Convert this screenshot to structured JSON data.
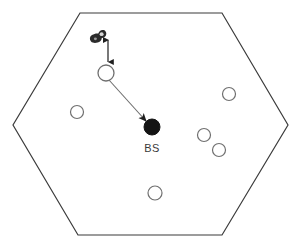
{
  "figure": {
    "type": "diagram",
    "title": "",
    "background_color": "#ffffff",
    "width": 303,
    "height": 245
  },
  "cell": {
    "name": "hexagonal-cell-boundary",
    "shape": "hexagon",
    "stroke_color": "#3b3b3b",
    "stroke_width": 1.2,
    "fill_color": "#ffffff",
    "vertices": [
      {
        "x": 80,
        "y": 13
      },
      {
        "x": 222,
        "y": 13
      },
      {
        "x": 288,
        "y": 125
      },
      {
        "x": 222,
        "y": 235
      },
      {
        "x": 78,
        "y": 235
      },
      {
        "x": 13,
        "y": 125
      }
    ]
  },
  "base_station": {
    "label": "BS",
    "marker": "filled-circle",
    "fill_color": "#141414",
    "x": 152,
    "y": 127,
    "radius": 8,
    "label_x": 142,
    "label_y": 151
  },
  "uav": {
    "name": "uav-icon",
    "marker": "dark-blob",
    "fill_color": "#2b2b2b",
    "x": 98,
    "y": 35,
    "width": 16,
    "height": 14
  },
  "altitude_arrow": {
    "name": "altitude-double-arrow",
    "label": "",
    "stroke_color": "#1f1f1f",
    "stroke_width": 1.2,
    "x": 108,
    "y_top": 37,
    "y_bottom": 64,
    "double_headed": true
  },
  "link_arrow": {
    "name": "uplink-arrow",
    "label": "",
    "stroke_color": "#6d6d6d",
    "stroke_width": 1.1,
    "from_x": 108,
    "from_y": 79,
    "to_x": 147,
    "to_y": 122,
    "arrowhead_at": "to"
  },
  "users": {
    "marker": "open-circle",
    "stroke_color": "#6f6f6f",
    "fill_color": "#ffffff",
    "stroke_width": 1.2,
    "nodes": [
      {
        "id": "user-served",
        "x": 106,
        "y": 73,
        "radius": 8,
        "highlight": true
      },
      {
        "id": "user-left",
        "x": 77,
        "y": 112,
        "radius": 6.5,
        "highlight": false
      },
      {
        "id": "user-upper-right",
        "x": 229,
        "y": 94,
        "radius": 6.5,
        "highlight": false
      },
      {
        "id": "user-mid-right",
        "x": 204,
        "y": 135,
        "radius": 6.5,
        "highlight": false
      },
      {
        "id": "user-lower-right",
        "x": 219,
        "y": 150,
        "radius": 6.5,
        "highlight": false
      },
      {
        "id": "user-bottom",
        "x": 155,
        "y": 193,
        "radius": 7,
        "highlight": false
      }
    ]
  }
}
